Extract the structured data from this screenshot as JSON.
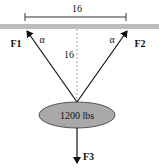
{
  "diagram": {
    "span_label": "16",
    "height_label": "16",
    "angle_left": "α",
    "angle_right": "α",
    "force_left": "F1",
    "force_right": "F2",
    "force_down": "F3",
    "weight_label": "1200 lbs"
  },
  "colors": {
    "ceiling": "#bdbdbd",
    "weight_fill": "#a9a9a9",
    "line": "#111111"
  }
}
